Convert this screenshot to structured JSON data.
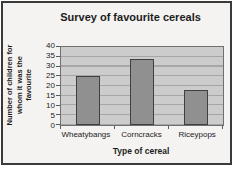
{
  "window": {
    "background": "#f4f3f1",
    "frame_border_color": "#3a3a3a"
  },
  "chart_data": {
    "type": "bar",
    "title": "Survey of favourite cereals",
    "categories": [
      "Wheatybangs",
      "Corncracks",
      "Riceypops"
    ],
    "values": [
      25,
      34,
      18
    ],
    "xlabel": "Type of cereal",
    "ylabel": "Number of children for whom it was the favourite",
    "ylabel_lines": [
      "Number of children for",
      "whom it was the",
      "favourite"
    ],
    "ylim": [
      0,
      40
    ],
    "ytick_step": 5,
    "yticks": [
      40,
      35,
      30,
      25,
      20,
      15,
      10,
      5,
      0
    ],
    "grid": true,
    "legend": false,
    "colors": {
      "plot_bg": "#cccccc",
      "gridline": "#a6a6a6",
      "bar_fill": "#909090",
      "bar_border": "#3f3f3f",
      "plot_border": "#707070"
    }
  }
}
